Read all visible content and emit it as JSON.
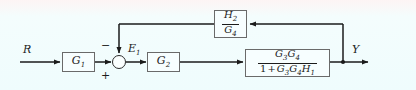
{
  "diagram": {
    "type": "block-diagram",
    "background_color": "#f2fdfd",
    "line_color": "#1b1b1b",
    "block_fill": "#f7feff",
    "signals": {
      "input": "R",
      "error": "E₁",
      "output": "Y"
    },
    "sum_junction": {
      "name": "summing-junction",
      "plus_sign": "+",
      "minus_sign": "−",
      "minus_position": "top-left",
      "plus_position": "bottom-left"
    },
    "blocks": [
      {
        "id": "g1",
        "label": "G",
        "subscript": "1",
        "kind": "gain"
      },
      {
        "id": "g2",
        "label": "G",
        "subscript": "2",
        "kind": "gain"
      },
      {
        "id": "inner-loop",
        "kind": "fraction",
        "numerator": "G₃G₄",
        "denominator": "1 + G₃G₄H₁",
        "numerator_parts": [
          {
            "sym": "G",
            "sub": "3"
          },
          {
            "sym": "G",
            "sub": "4"
          }
        ],
        "denominator_parts": [
          {
            "sym": "1",
            "sub": ""
          },
          {
            "sym": "+",
            "sub": ""
          },
          {
            "sym": "G",
            "sub": "3"
          },
          {
            "sym": "G",
            "sub": "4"
          },
          {
            "sym": "H",
            "sub": "1"
          }
        ]
      },
      {
        "id": "feedback",
        "kind": "fraction",
        "numerator": "H₂",
        "denominator": "G₄",
        "numerator_parts": [
          {
            "sym": "H",
            "sub": "2"
          }
        ],
        "denominator_parts": [
          {
            "sym": "G",
            "sub": "4"
          }
        ]
      }
    ]
  }
}
